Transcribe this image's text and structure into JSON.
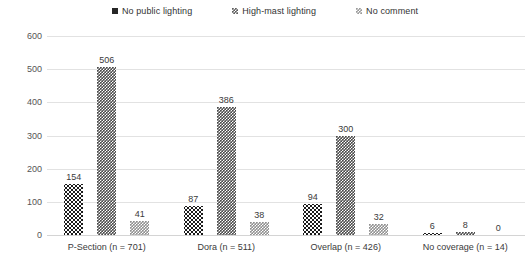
{
  "chart_data": {
    "type": "bar",
    "title": "",
    "xlabel": "",
    "ylabel": "",
    "ylim": [
      0,
      600
    ],
    "ytick_step": 100,
    "yticks": [
      "600",
      "500",
      "400",
      "300",
      "200",
      "100",
      "0"
    ],
    "grid": "horizontal",
    "legend_position": "top-center",
    "categories": [
      "P-Section (n = 701)",
      "Dora (n = 511)",
      "Overlap (n = 426)",
      "No coverage (n = 14)"
    ],
    "series": [
      {
        "name": "No public lighting",
        "swatch": "s1",
        "color": "#1c1c1c",
        "values": [
          154,
          87,
          94,
          6
        ]
      },
      {
        "name": "High-mast lighting",
        "swatch": "s2",
        "color": "#4a4a4a",
        "values": [
          506,
          386,
          300,
          8
        ]
      },
      {
        "name": "No comment",
        "swatch": "s3",
        "color": "#8f8f8f",
        "values": [
          41,
          38,
          32,
          0
        ]
      }
    ]
  },
  "legend": {
    "items": [
      {
        "label": "No public lighting"
      },
      {
        "label": "High-mast lighting"
      },
      {
        "label": "No comment"
      }
    ]
  },
  "axis": {
    "y": {
      "ticks": [
        "600",
        "500",
        "400",
        "300",
        "200",
        "100",
        "0"
      ]
    }
  }
}
